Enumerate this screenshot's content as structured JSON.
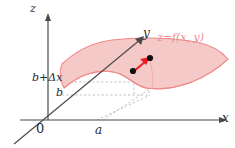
{
  "figure": {
    "type": "3d-coordinate-diagram",
    "background": "#ffffff"
  },
  "axes": {
    "z_label": "z",
    "y_label": "y",
    "x_label": "x",
    "origin_label": "0",
    "color": "#4a4a4a"
  },
  "ticks": {
    "x_tick_label": "a",
    "y_tick_label": "b",
    "y_tick_label_increment": "b+Δx"
  },
  "surface": {
    "label": "z=f(x,  y)",
    "fill_color": "#f6c9c9",
    "stroke_color": "#ef8a8a",
    "label_color": "#ef8a8a"
  },
  "annotations": {
    "arrow_color": "#ee1c24",
    "point_color": "#000000",
    "dashed_guide_color": "#b9b9b9",
    "point_1": "point on surface at (a, b)",
    "point_2": "point on surface at (a, b+Δx)"
  }
}
